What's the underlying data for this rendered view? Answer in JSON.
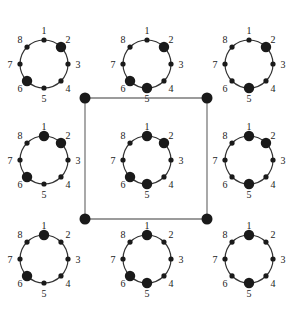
{
  "diagram": {
    "node_labels": [
      "1",
      "2",
      "3",
      "4",
      "5",
      "6",
      "7",
      "8"
    ],
    "colors": {
      "ink": "#1a1a1a",
      "square_edge": "#7a7a7a",
      "background": "#ffffff"
    },
    "configurations": [
      {
        "position": "top-left",
        "highlighted": [
          2,
          6
        ]
      },
      {
        "position": "top-center",
        "highlighted": [
          2,
          5,
          6
        ]
      },
      {
        "position": "top-right",
        "highlighted": [
          2,
          5
        ]
      },
      {
        "position": "middle-left",
        "highlighted": [
          1,
          2,
          6
        ]
      },
      {
        "position": "center",
        "highlighted": [
          1,
          2,
          5,
          6
        ]
      },
      {
        "position": "middle-right",
        "highlighted": [
          1,
          2,
          5
        ]
      },
      {
        "position": "bottom-left",
        "highlighted": [
          1,
          6
        ]
      },
      {
        "position": "bottom-center",
        "highlighted": [
          1,
          5,
          6
        ]
      },
      {
        "position": "bottom-right",
        "highlighted": [
          1,
          5
        ]
      }
    ],
    "square": {
      "encloses": "center",
      "corner_vertices": 4
    }
  }
}
